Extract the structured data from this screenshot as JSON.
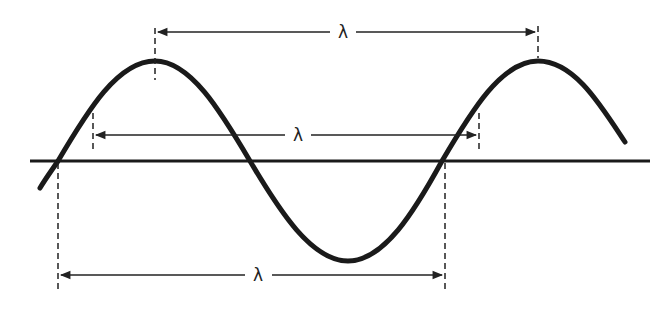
{
  "diagram": {
    "colors": {
      "wave": "#1a1a1a",
      "axis": "#1a1a1a",
      "markers": "#222222",
      "background": "#ffffff"
    },
    "labels": {
      "crest_to_crest": "λ",
      "arbitrary_points": "λ",
      "node_to_node": "λ"
    },
    "measurements": [
      {
        "id": "crest-to-crest",
        "label": "λ",
        "from": "crest 1",
        "to": "crest 2"
      },
      {
        "id": "arbitrary-points",
        "label": "λ",
        "from": "point on rising slope",
        "to": "equivalent point one wavelength later"
      },
      {
        "id": "node-to-node",
        "label": "λ",
        "from": "upward zero crossing",
        "to": "next upward zero crossing"
      }
    ]
  }
}
